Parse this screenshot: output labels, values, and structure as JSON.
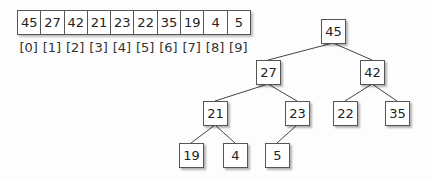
{
  "array": {
    "values": [
      "45",
      "27",
      "42",
      "21",
      "23",
      "22",
      "35",
      "19",
      "4",
      "5"
    ],
    "indices": [
      "[0]",
      "[1]",
      "[2]",
      "[3]",
      "[4]",
      "[5]",
      "[6]",
      "[7]",
      "[8]",
      "[9]"
    ]
  },
  "tree": {
    "nodes": [
      {
        "label": "45",
        "x": 333,
        "y": 31
      },
      {
        "label": "27",
        "x": 268,
        "y": 72
      },
      {
        "label": "42",
        "x": 372,
        "y": 72
      },
      {
        "label": "21",
        "x": 215,
        "y": 113
      },
      {
        "label": "23",
        "x": 297,
        "y": 113
      },
      {
        "label": "22",
        "x": 345,
        "y": 113
      },
      {
        "label": "35",
        "x": 397,
        "y": 113
      },
      {
        "label": "19",
        "x": 191,
        "y": 155
      },
      {
        "label": "4",
        "x": 235,
        "y": 155
      },
      {
        "label": "5",
        "x": 277,
        "y": 155
      }
    ],
    "edges": [
      [
        0,
        1
      ],
      [
        0,
        2
      ],
      [
        1,
        3
      ],
      [
        1,
        4
      ],
      [
        2,
        5
      ],
      [
        2,
        6
      ],
      [
        3,
        7
      ],
      [
        3,
        8
      ],
      [
        4,
        9
      ]
    ]
  }
}
